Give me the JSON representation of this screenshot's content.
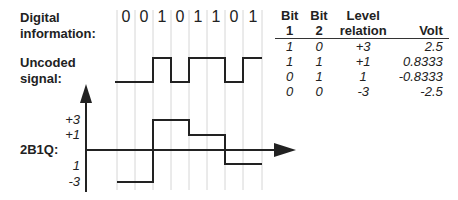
{
  "labels": {
    "digital_info": [
      "Digital",
      "information:"
    ],
    "uncoded": [
      "Uncoded",
      "signal:"
    ],
    "code": "2B1Q:"
  },
  "bits": [
    "0",
    "0",
    "1",
    "0",
    "1",
    "1",
    "0",
    "1"
  ],
  "ticks": [
    "+3",
    "+1",
    "1",
    "-3"
  ],
  "table": {
    "headers": [
      [
        "Bit",
        "1"
      ],
      [
        "Bit",
        "2"
      ],
      [
        "Level",
        "relation"
      ],
      [
        "",
        "Volt"
      ]
    ],
    "rows": [
      [
        "1",
        "0",
        "+3",
        "2.5"
      ],
      [
        "1",
        "1",
        "+1",
        "0.8333"
      ],
      [
        "0",
        "1",
        "1",
        "-0.8333"
      ],
      [
        "0",
        "0",
        "-3",
        "-2.5"
      ]
    ]
  }
}
